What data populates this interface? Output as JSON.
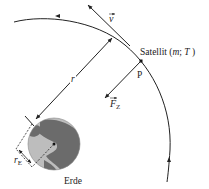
{
  "diagram": {
    "labels": {
      "velocity": "v",
      "satellite": "Satellit (",
      "satellite_m": "m",
      "satellite_sep": "; ",
      "satellite_T": "T",
      "satellite_close": " )",
      "point": "P",
      "force": "F",
      "force_sub": "Z",
      "radius": "r",
      "earth_radius": "r",
      "earth_radius_sub": "E",
      "earth": "Erde"
    },
    "colors": {
      "line": "#222222",
      "earth_land": "#6b6b6b",
      "earth_ocean": "#bdbdbd"
    }
  }
}
